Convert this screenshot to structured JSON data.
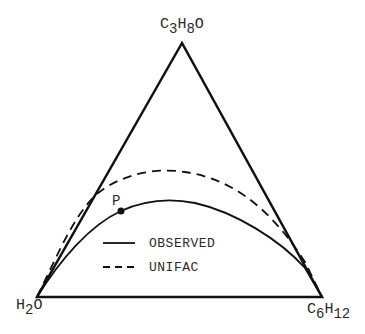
{
  "diagram": {
    "type": "ternary-phase-diagram",
    "vertices": {
      "top": {
        "base": [
          "C",
          "H",
          "O"
        ],
        "subs": [
          "3",
          "8",
          ""
        ]
      },
      "bottom_left": {
        "base": [
          "H",
          "O"
        ],
        "subs": [
          "2",
          ""
        ]
      },
      "bottom_right": {
        "base": [
          "C",
          "H"
        ],
        "subs": [
          "6",
          "12"
        ]
      }
    },
    "vertex_text": {
      "top": "C3H8O",
      "bottom_left": "H2O",
      "bottom_right": "C6H12"
    },
    "point": {
      "label": "P"
    },
    "legend": [
      {
        "style": "solid",
        "label": "OBSERVED"
      },
      {
        "style": "dashed",
        "label": "UNIFAC"
      }
    ],
    "colors": {
      "line": "#111111",
      "text": "#2a2a2a",
      "background": "#ffffff"
    }
  }
}
